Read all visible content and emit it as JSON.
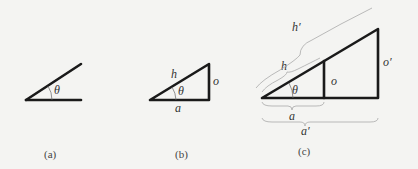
{
  "figure": {
    "panels": [
      {
        "id": "a",
        "caption": "(a)",
        "labels": {
          "angle": "θ"
        }
      },
      {
        "id": "b",
        "caption": "(b)",
        "labels": {
          "angle": "θ",
          "hypotenuse": "h",
          "opposite": "o",
          "adjacent": "a"
        }
      },
      {
        "id": "c",
        "caption": "(c)",
        "labels": {
          "angle": "θ",
          "hypotenuse": "h",
          "opposite": "o",
          "adjacent": "a",
          "hypotenuse_prime": "h′",
          "opposite_prime": "o′",
          "adjacent_prime": "a′"
        }
      }
    ],
    "colors": {
      "line": "#1a1a1a",
      "background": "#f4f4f2",
      "brace": "#aaaaaa"
    }
  }
}
